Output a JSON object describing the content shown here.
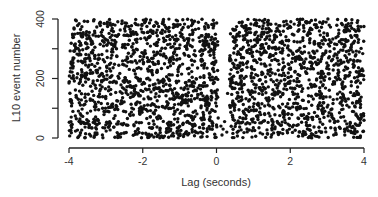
{
  "chart_data": {
    "type": "scatter",
    "title": "",
    "xlabel": "Lag (seconds)",
    "ylabel": "L10 event number",
    "xlim": [
      -4,
      4
    ],
    "ylim": [
      0,
      400
    ],
    "xticks": [
      -4,
      -2,
      0,
      2,
      4
    ],
    "xtick_labels": [
      "-4",
      "-2",
      "0",
      "2",
      "4"
    ],
    "yticks": [
      0,
      100,
      200,
      300,
      400
    ],
    "ytick_labels": [
      "0",
      "",
      "200",
      "",
      "400"
    ],
    "grid": false,
    "legend": null,
    "marker_color": "#111111",
    "series": [
      {
        "name": "left block",
        "description": "dense uniform scatter",
        "x_range": [
          -4.0,
          0.05
        ],
        "y_range": [
          0,
          400
        ],
        "approx_points": 1250
      },
      {
        "name": "right block",
        "description": "dense uniform scatter",
        "x_range": [
          0.35,
          4.0
        ],
        "y_range": [
          0,
          400
        ],
        "approx_points": 1130
      },
      {
        "name": "gap sparse points",
        "description": "few isolated points inside the empty gap at low event numbers",
        "points": [
          [
            0.12,
            40
          ],
          [
            0.18,
            30
          ],
          [
            0.22,
            55
          ],
          [
            0.28,
            20
          ],
          [
            0.3,
            150
          ],
          [
            0.15,
            10
          ]
        ]
      }
    ],
    "annotations": []
  }
}
